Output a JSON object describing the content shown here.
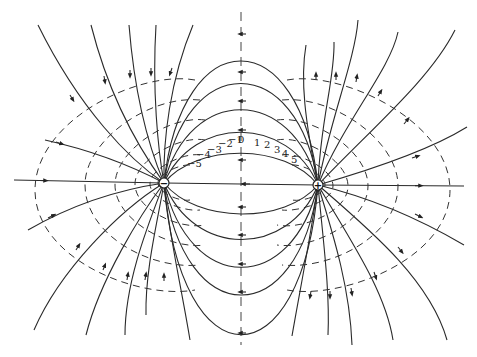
{
  "figure": {
    "type": "electric dipole field diagram",
    "charges": [
      {
        "id": "negative",
        "sign": "−",
        "x": 164,
        "y": 183
      },
      {
        "id": "positive",
        "sign": "+",
        "x": 318,
        "y": 185
      }
    ],
    "potential_labels": [
      "−5",
      "−4",
      "−3",
      "−2",
      "−1",
      "0",
      "1",
      "2",
      "3",
      "4",
      "5"
    ],
    "legend": {
      "solid_lines": "field lines",
      "dashed_lines": "equipotentials"
    },
    "colors": {
      "ink": "#2a2a2a",
      "background": "#ffffff"
    }
  }
}
